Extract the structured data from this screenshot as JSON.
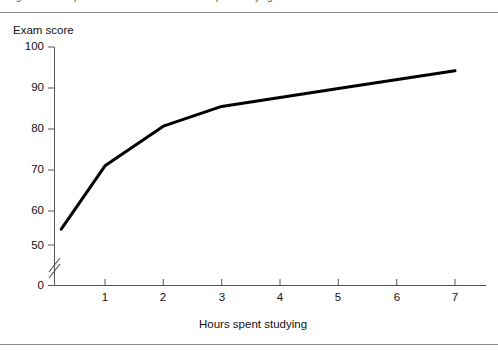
{
  "figure": {
    "caption": "Figure  A scatterplot of exam score versus hours spent studying",
    "background_color": "#ffffff",
    "rule_color": "#8a8a8a"
  },
  "chart_data": {
    "type": "line",
    "title": "",
    "xlabel": "Hours spent studying",
    "ylabel": "Exam score",
    "x": [
      0.25,
      1,
      2,
      3,
      5,
      7
    ],
    "values": [
      54,
      70,
      80,
      85,
      89.5,
      94
    ],
    "series": [
      {
        "name": "Exam score",
        "x": [
          0.25,
          1,
          2,
          3,
          5,
          7
        ],
        "values": [
          54,
          70,
          80,
          85,
          89.5,
          94
        ],
        "color": "#000000",
        "line_width": 3
      }
    ],
    "xlim": [
      0,
      7.6
    ],
    "ylim": [
      50,
      100
    ],
    "xticks": [
      1,
      2,
      3,
      4,
      5,
      6,
      7
    ],
    "xtick_labels": [
      "1",
      "2",
      "3",
      "4",
      "5",
      "6",
      "7"
    ],
    "yticks": [
      50,
      60,
      70,
      80,
      90,
      100
    ],
    "ytick_labels": [
      "50",
      "60",
      "70",
      "80",
      "90",
      "100"
    ],
    "y_zero_label": "0",
    "y_axis_break": true,
    "grid": false,
    "legend": false
  }
}
